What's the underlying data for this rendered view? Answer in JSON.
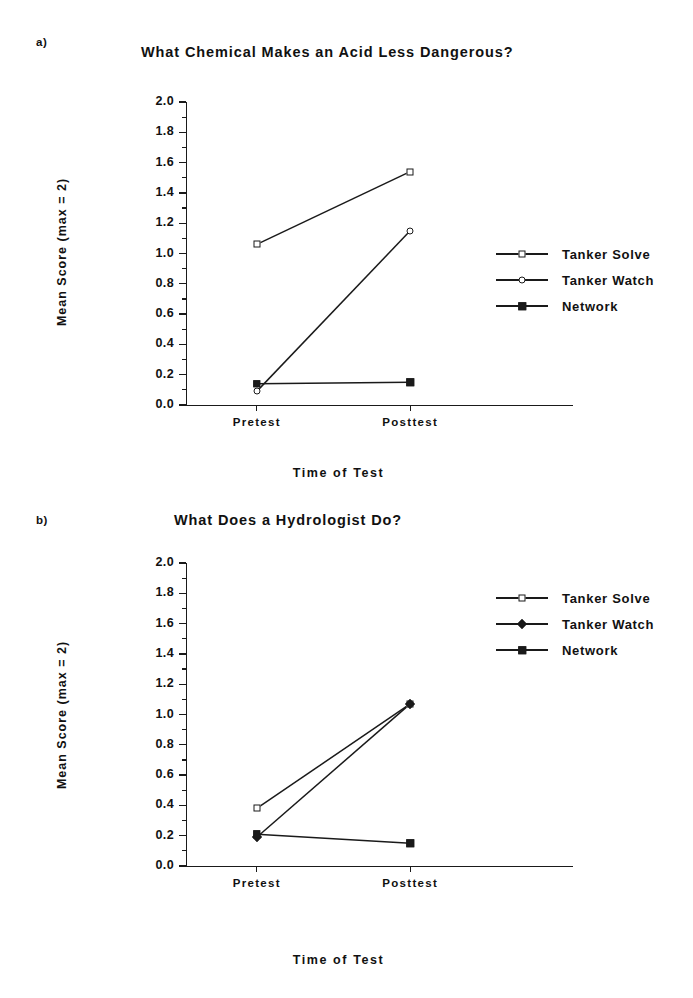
{
  "figure": {
    "panels": [
      {
        "tag": "a)",
        "title": "What Chemical Makes an Acid Less Dangerous?",
        "ylabel": "Mean Score (max = 2)",
        "xlabel": "Time of Test",
        "xticks": [
          "Pretest",
          "Posttest"
        ],
        "yticks": [
          "0.0",
          "0.2",
          "0.4",
          "0.6",
          "0.8",
          "1.0",
          "1.2",
          "1.4",
          "1.6",
          "1.8",
          "2.0"
        ],
        "legend": [
          {
            "label": "Tanker Solve",
            "marker": "open-square"
          },
          {
            "label": "Tanker Watch",
            "marker": "open-circle"
          },
          {
            "label": "Network",
            "marker": "filled-square"
          }
        ]
      },
      {
        "tag": "b)",
        "title": "What Does a Hydrologist Do?",
        "ylabel": "Mean Score (max = 2)",
        "xlabel": "Time of Test",
        "xticks": [
          "Pretest",
          "Posttest"
        ],
        "yticks": [
          "0.0",
          "0.2",
          "0.4",
          "0.6",
          "0.8",
          "1.0",
          "1.2",
          "1.4",
          "1.6",
          "1.8",
          "2.0"
        ],
        "legend": [
          {
            "label": "Tanker Solve",
            "marker": "open-square"
          },
          {
            "label": "Tanker Watch",
            "marker": "filled-diamond"
          },
          {
            "label": "Network",
            "marker": "filled-square"
          }
        ]
      }
    ]
  },
  "chart_data": [
    {
      "type": "line",
      "panel": "a",
      "title": "What Chemical Makes an Acid Less Dangerous?",
      "xlabel": "Time of Test",
      "ylabel": "Mean Score (max = 2)",
      "categories": [
        "Pretest",
        "Posttest"
      ],
      "ylim": [
        0.0,
        2.0
      ],
      "ytick_step": 0.2,
      "minor_ticks": true,
      "grid": false,
      "legend_position": "right-middle",
      "series": [
        {
          "name": "Tanker Solve",
          "marker": "open-square",
          "values": [
            1.06,
            1.54
          ]
        },
        {
          "name": "Tanker Watch",
          "marker": "open-circle",
          "values": [
            0.09,
            1.15
          ]
        },
        {
          "name": "Network",
          "marker": "filled-square",
          "values": [
            0.14,
            0.15
          ]
        }
      ]
    },
    {
      "type": "line",
      "panel": "b",
      "title": "What Does a Hydrologist Do?",
      "xlabel": "Time of Test",
      "ylabel": "Mean Score (max = 2)",
      "categories": [
        "Pretest",
        "Posttest"
      ],
      "ylim": [
        0.0,
        2.0
      ],
      "ytick_step": 0.2,
      "minor_ticks": true,
      "grid": false,
      "legend_position": "right-upper",
      "series": [
        {
          "name": "Tanker Solve",
          "marker": "open-square",
          "values": [
            0.38,
            1.07
          ]
        },
        {
          "name": "Tanker Watch",
          "marker": "filled-diamond",
          "values": [
            0.19,
            1.07
          ]
        },
        {
          "name": "Network",
          "marker": "filled-square",
          "values": [
            0.21,
            0.15
          ]
        }
      ]
    }
  ]
}
